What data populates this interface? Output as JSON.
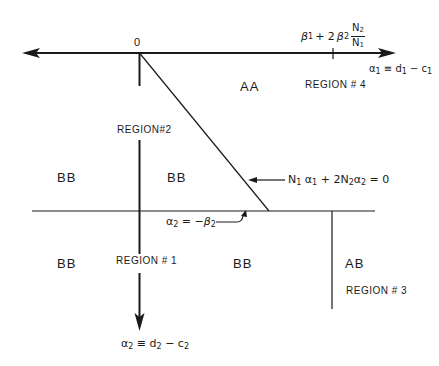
{
  "diagram": {
    "origin_label": "0",
    "axes": {
      "horizontal": {
        "label_var": "α",
        "label_sub": "1",
        "label_eq": " ≡ d",
        "label_sub2": "1",
        "label_minus": " − c",
        "label_sub3": "1",
        "full_label": "α1 ≡ d1 − c1"
      },
      "vertical": {
        "label_var": "α",
        "label_sub": "2",
        "label_eq": " ≡ d",
        "label_sub2": "2",
        "label_minus": " − c",
        "label_sub3": "2",
        "full_label": "α2 ≡ d2 − c2"
      }
    },
    "tick_label": {
      "beta1": "β",
      "beta1_sub": "1",
      "plus": "+ 2",
      "beta2": "β",
      "beta2_sub": "2",
      "frac_num": "N",
      "frac_num_sub": "2",
      "frac_den": "N",
      "frac_den_sub": "1",
      "full_label": "β1 + 2β2 N2/N1"
    },
    "lines": {
      "diagonal": {
        "n1": "N",
        "n1_sub": "1",
        "a1": "α",
        "a1_sub": "1",
        "plus": " + 2N",
        "n2_sub": "2",
        "a2": "α",
        "a2_sub": "2",
        "eq": " = 0",
        "full_label": "N1α1 + 2N2α2 = 0"
      },
      "horizontal": {
        "a2": "α",
        "a2_sub": "2",
        "eq": " = −",
        "b2": "β",
        "b2_sub": "2",
        "full_label": "α2 = −β2"
      }
    },
    "regions": [
      {
        "id": "region-1",
        "label": "REGION # 1"
      },
      {
        "id": "region-2",
        "label": "REGION#2"
      },
      {
        "id": "region-3",
        "label": "REGION # 3"
      },
      {
        "id": "region-4",
        "label": "REGION # 4"
      }
    ],
    "strategy_labels": {
      "aa": "AA",
      "bb_upper_left": "BB",
      "bb_upper_mid": "BB",
      "bb_lower_left": "BB",
      "bb_lower_mid": "BB",
      "ab": "AB"
    }
  }
}
